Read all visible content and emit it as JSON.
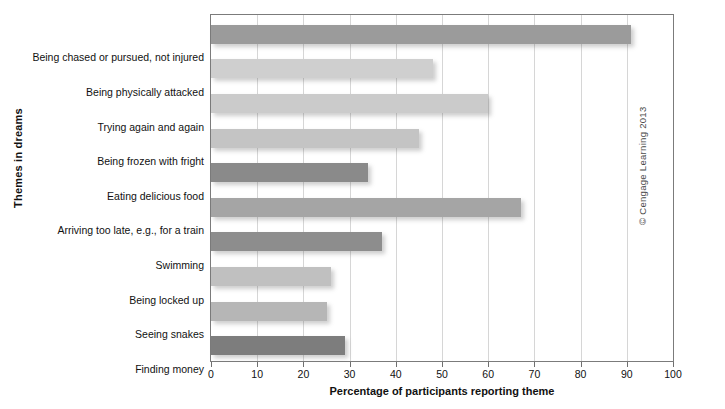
{
  "chart_data": {
    "type": "bar",
    "orientation": "horizontal",
    "title": "",
    "xlabel": "Percentage of participants reporting theme",
    "ylabel": "Themes in dreams",
    "xlim": [
      0,
      100
    ],
    "xticks": [
      0,
      10,
      20,
      30,
      40,
      50,
      60,
      70,
      80,
      90,
      100
    ],
    "grid": true,
    "legend": false,
    "categories": [
      "Being chased or pursued, not injured",
      "Being physically attacked",
      "Trying again and again",
      "Being frozen with fright",
      "Eating delicious food",
      "Arriving too late, e.g., for a train",
      "Swimming",
      "Being locked up",
      "Seeing snakes",
      "Finding money"
    ],
    "values": [
      91,
      48,
      60,
      45,
      34,
      67,
      37,
      26,
      25,
      29
    ],
    "bar_colors": [
      "#9b9b9b",
      "#cfcfcf",
      "#cbcbcb",
      "#c4c4c4",
      "#8a8a8a",
      "#a5a5a5",
      "#8d8d8d",
      "#c0c0c0",
      "#b6b6b6",
      "#7d7d7d"
    ]
  },
  "footer": {
    "copyright": "© Cengage Learning 2013"
  },
  "axis": {
    "tick_labels": [
      "0",
      "10",
      "20",
      "30",
      "40",
      "50",
      "60",
      "70",
      "80",
      "90",
      "100"
    ]
  }
}
